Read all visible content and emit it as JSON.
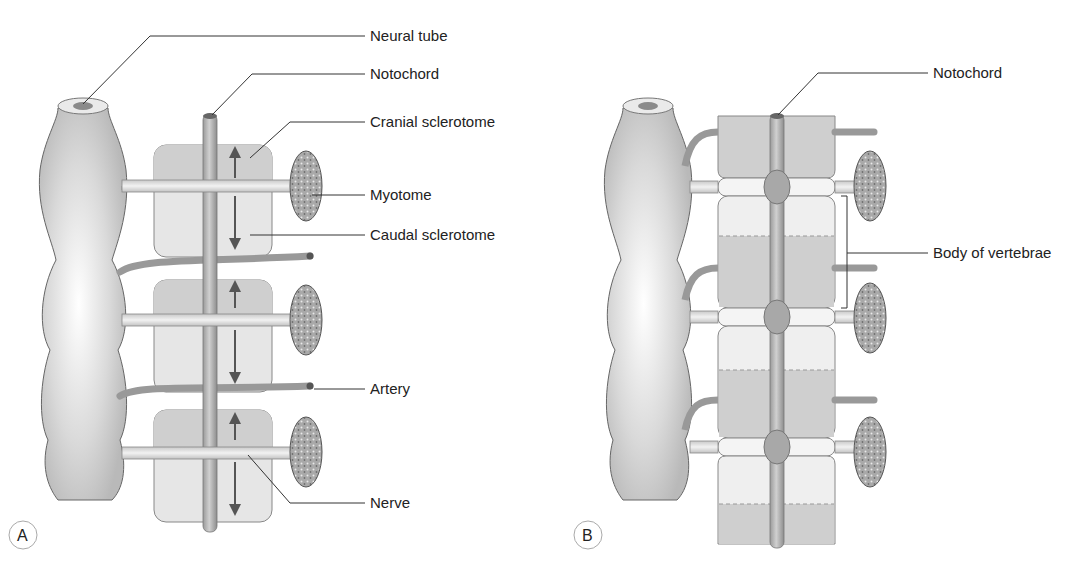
{
  "figure": {
    "panels": [
      {
        "id": "A",
        "panel_label": "A",
        "labels": [
          {
            "text": "Neural tube"
          },
          {
            "text": "Notochord"
          },
          {
            "text": "Cranial sclerotome"
          },
          {
            "text": "Myotome"
          },
          {
            "text": "Caudal sclerotome"
          },
          {
            "text": "Artery"
          },
          {
            "text": "Nerve"
          }
        ]
      },
      {
        "id": "B",
        "panel_label": "B",
        "labels": [
          {
            "text": "Notochord"
          },
          {
            "text": "Body of vertebrae"
          }
        ]
      }
    ]
  }
}
